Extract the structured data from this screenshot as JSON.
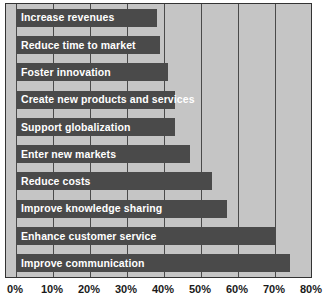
{
  "chart_data": {
    "type": "bar",
    "orientation": "horizontal",
    "title": "",
    "subtitle": "",
    "xlabel": "",
    "ylabel": "",
    "xlim": [
      0,
      80
    ],
    "xtick_labels": [
      "0%",
      "10%",
      "20%",
      "30%",
      "40%",
      "50%",
      "60%",
      "70%",
      "80%"
    ],
    "xtick_values": [
      0,
      10,
      20,
      30,
      40,
      50,
      60,
      70,
      80
    ],
    "grid": true,
    "legend": false,
    "categories": [
      "Increase revenues",
      "Reduce time to market",
      "Foster innovation",
      "Create new products and services",
      "Support globalization",
      "Enter new markets",
      "Reduce costs",
      "Improve knowledge sharing",
      "Enhance customer service",
      "Improve communication"
    ],
    "values": [
      38,
      39,
      41,
      43,
      43,
      47,
      53,
      57,
      70,
      74
    ],
    "value_unit": "%",
    "bar_color": "#4a4a4a",
    "plot_background": "#c5c5c5",
    "gridline_color": "#4a4a4a",
    "label_color": "#ffffff",
    "axis_text_color": "#1a1a1a"
  }
}
